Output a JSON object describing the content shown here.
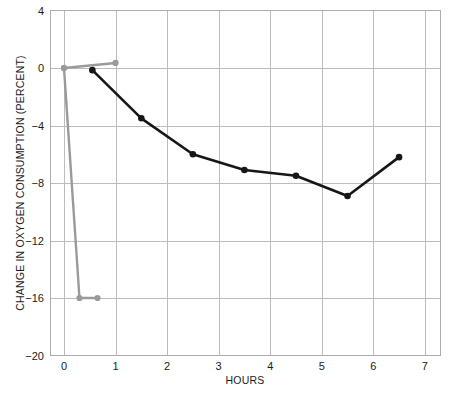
{
  "chart_data": {
    "type": "line",
    "title": "",
    "xlabel": "HOURS",
    "ylabel": "CHANGE IN OXYGEN CONSUMPTION (PERCENT)",
    "xlim": [
      -0.25,
      7.3
    ],
    "ylim": [
      -20,
      4
    ],
    "xticks": [
      0,
      1,
      2,
      3,
      4,
      5,
      6,
      7
    ],
    "xtick_labels": [
      "0",
      "1",
      "2",
      "3",
      "4",
      "5",
      "6",
      "7"
    ],
    "yticks": [
      4,
      0,
      -4,
      -8,
      -12,
      -16,
      -20
    ],
    "ytick_labels": [
      "4",
      "0",
      "−4",
      "−8",
      "−12",
      "−16",
      "−20"
    ],
    "grid": true,
    "legend": "none",
    "series": [
      {
        "name": "gray-series",
        "color": "#9a9a9a",
        "marker": "circle",
        "points": [
          {
            "x": 0.0,
            "y": 0.0
          },
          {
            "x": 1.0,
            "y": 0.35
          }
        ]
      },
      {
        "name": "gray-series-drop",
        "color": "#9a9a9a",
        "marker": "circle",
        "points": [
          {
            "x": 0.0,
            "y": 0.0
          },
          {
            "x": 0.3,
            "y": -16.0
          },
          {
            "x": 0.65,
            "y": -16.0
          }
        ]
      },
      {
        "name": "black-series",
        "color": "#161616",
        "marker": "circle",
        "points": [
          {
            "x": 0.55,
            "y": -0.15
          },
          {
            "x": 1.5,
            "y": -3.5
          },
          {
            "x": 2.5,
            "y": -6.0
          },
          {
            "x": 3.5,
            "y": -7.1
          },
          {
            "x": 4.5,
            "y": -7.5
          },
          {
            "x": 5.5,
            "y": -8.9
          },
          {
            "x": 6.5,
            "y": -6.2
          }
        ]
      }
    ]
  },
  "axes": {
    "x_axis_name": "hours-axis",
    "y_axis_name": "percent-axis"
  }
}
